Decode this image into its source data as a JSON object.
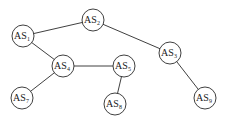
{
  "diagram": {
    "type": "network-graph",
    "node_radius": 11,
    "nodes": [
      {
        "id": "AS1",
        "prefix": "AS",
        "sub": "1",
        "x": 23,
        "y": 36
      },
      {
        "id": "AS2",
        "prefix": "AS",
        "sub": "2",
        "x": 93,
        "y": 20
      },
      {
        "id": "AS3",
        "prefix": "AS",
        "sub": "3",
        "x": 170,
        "y": 53
      },
      {
        "id": "AS4",
        "prefix": "AS",
        "sub": "4",
        "x": 63,
        "y": 66
      },
      {
        "id": "AS5",
        "prefix": "AS",
        "sub": "5",
        "x": 124,
        "y": 66
      },
      {
        "id": "AS7",
        "prefix": "AS",
        "sub": "7",
        "x": 22,
        "y": 98
      },
      {
        "id": "AS8",
        "prefix": "AS",
        "sub": "8",
        "x": 115,
        "y": 104
      },
      {
        "id": "AS9",
        "prefix": "AS",
        "sub": "9",
        "x": 205,
        "y": 98
      }
    ],
    "edges": [
      {
        "from": "AS1",
        "to": "AS2"
      },
      {
        "from": "AS2",
        "to": "AS3"
      },
      {
        "from": "AS1",
        "to": "AS4"
      },
      {
        "from": "AS4",
        "to": "AS5"
      },
      {
        "from": "AS4",
        "to": "AS7"
      },
      {
        "from": "AS5",
        "to": "AS8"
      },
      {
        "from": "AS3",
        "to": "AS9"
      }
    ],
    "colors": {
      "stroke": "#2a2a2a",
      "fill": "#ffffff",
      "text": "#1a1a1a"
    }
  }
}
